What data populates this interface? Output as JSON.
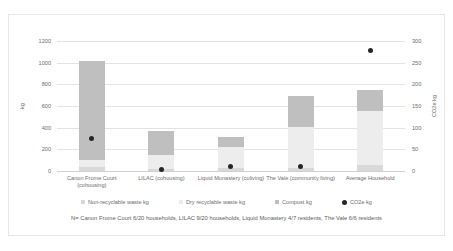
{
  "chart_data": {
    "type": "bar",
    "subtype": "stacked-bar-with-scatter-overlay",
    "title": "",
    "xlabel": "",
    "ylabel": "kg",
    "y2label": "CO2e kg",
    "ylim": [
      0,
      1200
    ],
    "y2lim": [
      0,
      300
    ],
    "yticks": [
      0,
      200,
      400,
      600,
      800,
      1000,
      1200
    ],
    "y2ticks": [
      0,
      50,
      100,
      150,
      200,
      250,
      300
    ],
    "grid": true,
    "legend_position": "bottom",
    "categories": [
      "Canon Frome Court (cohousing)",
      "LILAC (cohousing)",
      "Liquid Monastery (coliving)",
      "The Vale (community living)",
      "Average Household"
    ],
    "series": [
      {
        "name": "Non-recyclable waste kg",
        "color": "#d9d9d9",
        "axis": "left",
        "values": [
          40,
          20,
          30,
          25,
          60
        ]
      },
      {
        "name": "Dry recyclable waste kg",
        "color": "#ededed",
        "axis": "left",
        "values": [
          65,
          130,
          190,
          385,
          490
        ]
      },
      {
        "name": "Compost kg",
        "color": "#bfbfbf",
        "axis": "left",
        "values": [
          915,
          215,
          95,
          280,
          195
        ]
      },
      {
        "name": "CO2e kg",
        "color": "#262626",
        "axis": "right",
        "type": "scatter",
        "values": [
          75,
          3,
          10,
          10,
          278
        ]
      }
    ],
    "totals_left_axis": [
      1020,
      365,
      315,
      690,
      745
    ],
    "footnote": "N= Canon Frome Court 6/20 households, LILAC 9/20 households, Liquid Monastery 4/7 residents, The Vale 6/6 residents"
  },
  "legend": {
    "items": [
      {
        "label": "Non-recyclable waste kg",
        "color": "#d9d9d9",
        "shape": "square"
      },
      {
        "label": "Dry recyclable waste kg",
        "color": "#ededed",
        "shape": "square"
      },
      {
        "label": "Compost kg",
        "color": "#bfbfbf",
        "shape": "square"
      },
      {
        "label": "CO2e kg",
        "color": "#262626",
        "shape": "circle"
      }
    ]
  }
}
